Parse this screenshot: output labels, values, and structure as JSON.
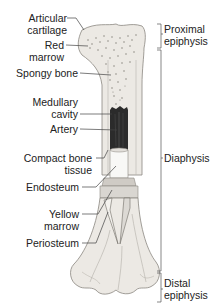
{
  "diagram": {
    "left_labels": [
      {
        "id": "articular-cartilage",
        "lines": [
          "Articular",
          "cartilage"
        ]
      },
      {
        "id": "red-marrow",
        "lines": [
          "Red",
          "marrow"
        ]
      },
      {
        "id": "spongy-bone",
        "lines": [
          "Spongy bone"
        ]
      },
      {
        "id": "medullary-cavity",
        "lines": [
          "Medullary",
          "cavity"
        ]
      },
      {
        "id": "artery",
        "lines": [
          "Artery"
        ]
      },
      {
        "id": "compact-bone-tissue",
        "lines": [
          "Compact bone",
          "tissue"
        ]
      },
      {
        "id": "endosteum",
        "lines": [
          "Endosteum"
        ]
      },
      {
        "id": "yellow-marrow",
        "lines": [
          "Yellow",
          "marrow"
        ]
      },
      {
        "id": "periosteum",
        "lines": [
          "Periosteum"
        ]
      }
    ],
    "right_brackets": [
      {
        "id": "proximal-epiphysis",
        "lines": [
          "Proximal",
          "epiphysis"
        ]
      },
      {
        "id": "diaphysis",
        "lines": [
          "Diaphysis"
        ]
      },
      {
        "id": "distal-epiphysis",
        "lines": [
          "Distal",
          "epiphysis"
        ]
      }
    ],
    "colors": {
      "bone_fill": "#ece9e4",
      "bone_shaded": "#d6d3ce",
      "bone_outline": "#8a8780",
      "medullary_dark": "#2b2b2b",
      "leader_line": "#444444",
      "text": "#222222"
    }
  }
}
